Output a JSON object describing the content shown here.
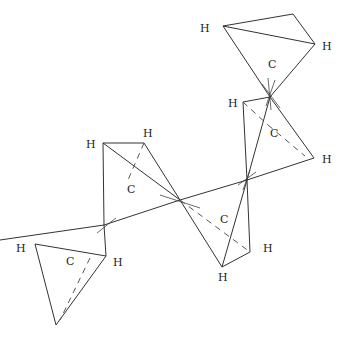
{
  "diagram": {
    "title": "",
    "atoms": {
      "carbon_label": "C",
      "hydrogen_label": "H"
    },
    "labels": [
      {
        "id": "h1",
        "text": "H",
        "x": 210,
        "y": 38
      },
      {
        "id": "h2",
        "text": "H",
        "x": 325,
        "y": 50
      },
      {
        "id": "c1",
        "text": "C",
        "x": 268,
        "y": 67
      },
      {
        "id": "h3",
        "text": "H",
        "x": 229,
        "y": 107
      },
      {
        "id": "c2",
        "text": "C",
        "x": 270,
        "y": 137
      },
      {
        "id": "h4",
        "text": "H",
        "x": 325,
        "y": 163
      },
      {
        "id": "h5",
        "text": "H",
        "x": 88,
        "y": 148
      },
      {
        "id": "h6",
        "text": "H",
        "x": 143,
        "y": 137
      },
      {
        "id": "c3",
        "text": "C",
        "x": 128,
        "y": 193
      },
      {
        "id": "c4",
        "text": "C",
        "x": 220,
        "y": 223
      },
      {
        "id": "h7",
        "text": "H",
        "x": 262,
        "y": 250
      },
      {
        "id": "h8",
        "text": "H",
        "x": 218,
        "y": 280
      },
      {
        "id": "h9",
        "text": "H",
        "x": 16,
        "y": 250
      },
      {
        "id": "c5",
        "text": "C",
        "x": 66,
        "y": 264
      },
      {
        "id": "h10",
        "text": "H",
        "x": 114,
        "y": 265
      }
    ]
  }
}
